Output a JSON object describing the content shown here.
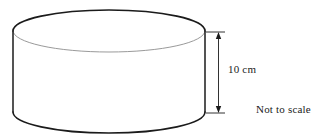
{
  "figure": {
    "type": "geometry-diagram",
    "shape_name": "cylinder",
    "background_color": "#ffffff",
    "outline_color": "#1b1b1b",
    "hidden_edge_color": "#9a9a9a",
    "dimension_color": "#1b1b1b",
    "labels": {
      "height": "10 cm",
      "disclaimer": "Not to scale"
    },
    "dimension": {
      "name": "height",
      "value": 10,
      "unit": "cm",
      "text": "10 cm",
      "orientation": "vertical",
      "arrowheads": "both"
    },
    "geometry": {
      "cylinder": {
        "center_x": 109,
        "left_x": 13,
        "right_x": 205,
        "radius_x": 96,
        "radius_y": 21,
        "top_ellipse_center_y": 31,
        "bottom_ellipse_center_y": 112,
        "top_extreme_y": 10,
        "bottom_extreme_y": 133
      },
      "dimension_line": {
        "x": 218,
        "top_y": 32,
        "bottom_y": 113,
        "extension_start_x": 206,
        "extension_end_x": 224
      }
    }
  }
}
